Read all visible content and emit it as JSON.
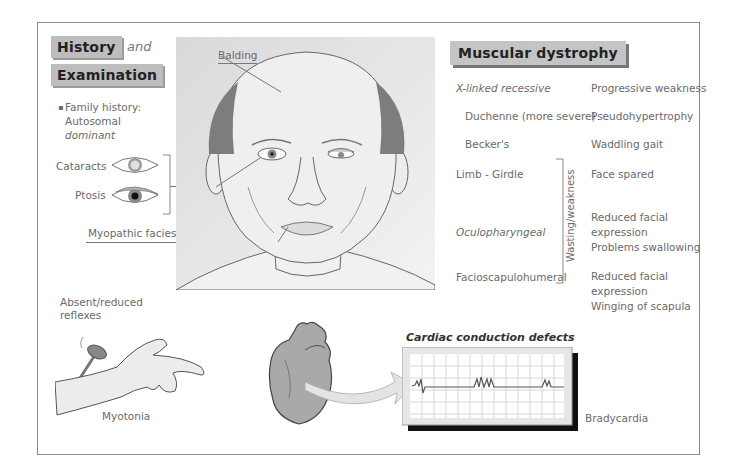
{
  "left_panel": {
    "heading_1": "History",
    "connector": "and",
    "heading_2": "Examination",
    "family_history": {
      "bullet": "▪",
      "line1": "Family history:",
      "line2": "Autosomal",
      "line3": "dominant"
    },
    "eye_labels": {
      "cataracts": "Cataracts",
      "ptosis": "Ptosis"
    },
    "myopathic_facies": "Myopathic facies"
  },
  "face_panel": {
    "balding_label": "Balding"
  },
  "right_panel": {
    "heading": "Muscular dystrophy",
    "rows": [
      {
        "type": "X-linked recessive",
        "feature": "Progressive weakness"
      },
      {
        "type": "Duchenne (more severe)",
        "feature": "Pseudohypertrophy"
      },
      {
        "type": "Becker's",
        "feature": "Waddling gait"
      },
      {
        "type": "Limb - Girdle",
        "feature": "Face spared"
      },
      {
        "type": "Oculopharyngeal",
        "feature_lines": [
          "Reduced facial",
          "expression",
          "Problems swallowing"
        ]
      },
      {
        "type": "Facioscapulohumeral",
        "feature_lines": [
          "Reduced facial",
          "expression",
          "Winging of scapula"
        ]
      }
    ],
    "bracket_label": "Wasting/weakness"
  },
  "bottom": {
    "reflexes_line1": "Absent/reduced",
    "reflexes_line2": "reflexes",
    "myotonia": "Myotonia",
    "ecg_title": "Cardiac conduction defects",
    "bradycardia": "Bradycardia"
  },
  "colors": {
    "tag_bg": "#bdbdbd",
    "frame": "#8a8a8a",
    "text": "#6a6a6a",
    "ecg_grid": "#cfcfcf",
    "ecg_trace": "#555555"
  }
}
